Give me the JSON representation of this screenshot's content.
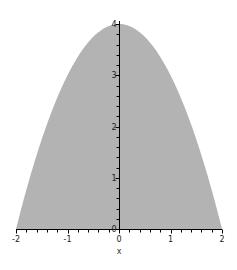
{
  "chart_data": {
    "type": "area",
    "title": "",
    "function": "4 - x^2",
    "xlabel": "x",
    "ylabel": "",
    "xlim": [
      -2,
      2
    ],
    "ylim": [
      0,
      4
    ],
    "x_ticks": [
      "-2",
      "-1",
      "0",
      "1",
      "2"
    ],
    "y_ticks": [
      "0",
      "1",
      "2",
      "3",
      "4"
    ],
    "x_minor_step": 0.2,
    "y_minor_step": 0.2,
    "grid": false,
    "legend": null,
    "fill_color": "#b3b3b3",
    "series": [
      {
        "name": "4 - x^2",
        "x": [
          -2,
          -1.5,
          -1,
          -0.5,
          0,
          0.5,
          1,
          1.5,
          2
        ],
        "values": [
          0,
          1.75,
          3,
          3.75,
          4,
          3.75,
          3,
          1.75,
          0
        ]
      }
    ]
  }
}
